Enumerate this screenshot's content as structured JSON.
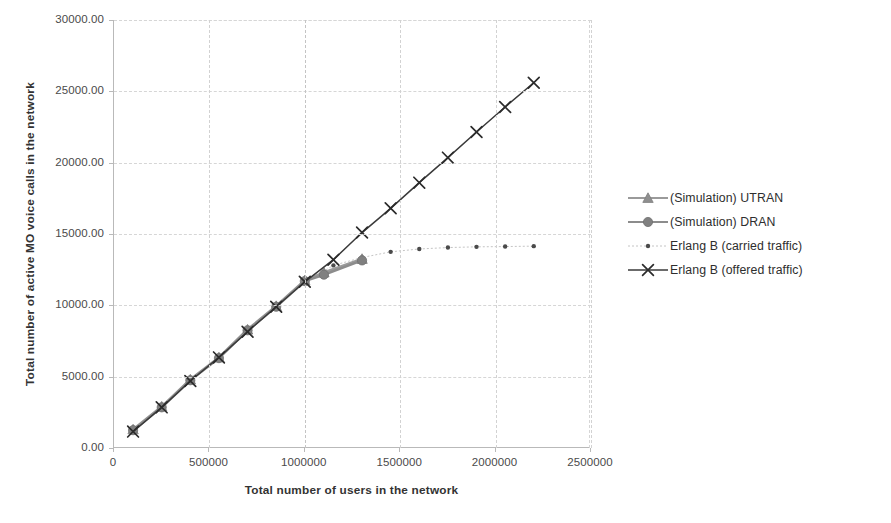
{
  "chart_data": {
    "type": "line",
    "title": "",
    "xlabel": "Total number of users in the network",
    "ylabel": "Total number of active MO voice calls in the network",
    "xlim": [
      0,
      2500000
    ],
    "ylim": [
      0,
      30000
    ],
    "xticks": [
      0,
      500000,
      1000000,
      1500000,
      2000000,
      2500000
    ],
    "xtick_labels": [
      "0",
      "500000",
      "1000000",
      "1500000",
      "2000000",
      "2500000"
    ],
    "yticks": [
      0,
      5000,
      10000,
      15000,
      20000,
      25000,
      30000
    ],
    "ytick_labels": [
      "0.00",
      "5000.00",
      "10000.00",
      "15000.00",
      "20000.00",
      "25000.00",
      "30000.00"
    ],
    "grid": "dashed-light-both",
    "legend_position": "right",
    "annotations": [
      {
        "type": "vertical-gridline",
        "x": 1000000,
        "note": "capacity reference line"
      }
    ],
    "series": [
      {
        "name": "(Simulation) UTRAN",
        "marker": "triangle",
        "color": "#8f8f8f",
        "line_color": "#9a9a9a",
        "x": [
          100000,
          250000,
          400000,
          550000,
          700000,
          850000,
          1000000,
          1100000,
          1300000
        ],
        "y": [
          1300,
          2900,
          4800,
          6350,
          8300,
          9950,
          11750,
          12300,
          13250
        ]
      },
      {
        "name": "(Simulation) DRAN",
        "marker": "circle",
        "color": "#808080",
        "line_color": "#8c8c8c",
        "x": [
          100000,
          250000,
          400000,
          550000,
          700000,
          850000,
          1000000,
          1100000,
          1300000
        ],
        "y": [
          1250,
          2850,
          4750,
          6300,
          8250,
          9900,
          11700,
          12150,
          13150
        ]
      },
      {
        "name": "Erlang B (carried traffic)",
        "marker": "small-dot",
        "color": "#4a4a4a",
        "line_color": "#bdbdbd",
        "x": [
          100000,
          250000,
          400000,
          550000,
          700000,
          850000,
          1000000,
          1150000,
          1300000,
          1450000,
          1600000,
          1750000,
          1900000,
          2050000,
          2200000
        ],
        "y": [
          1150,
          2850,
          4700,
          6300,
          8150,
          9900,
          11600,
          12800,
          13350,
          13750,
          13950,
          14050,
          14100,
          14120,
          14150
        ]
      },
      {
        "name": "Erlang B (offered traffic)",
        "marker": "x",
        "color": "#2b2b2b",
        "line_color": "#3a3a3a",
        "x": [
          100000,
          250000,
          400000,
          550000,
          700000,
          850000,
          1000000,
          1150000,
          1300000,
          1450000,
          1600000,
          1750000,
          1900000,
          2050000,
          2200000
        ],
        "y": [
          1150,
          2850,
          4700,
          6350,
          8150,
          9900,
          11650,
          13200,
          15100,
          16800,
          18600,
          20350,
          22150,
          23900,
          25600
        ]
      }
    ]
  },
  "legend": {
    "items": [
      {
        "label": "(Simulation) UTRAN",
        "marker": "triangle"
      },
      {
        "label": "(Simulation) DRAN",
        "marker": "circle"
      },
      {
        "label": "Erlang B (carried traffic)",
        "marker": "small-dot"
      },
      {
        "label": "Erlang B (offered traffic)",
        "marker": "x"
      }
    ]
  }
}
